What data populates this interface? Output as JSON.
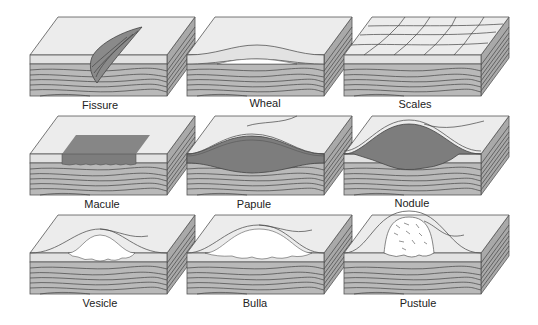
{
  "figure": {
    "type": "skin-lesion-diagram",
    "colors": {
      "surface": "#ececec",
      "epidermis": "#e2e2e2",
      "dermis": "#b9b9b9",
      "side": "#a9a9a9",
      "lesion": "#7d7d7d",
      "fluid": "#ffffff",
      "outline": "#555555"
    },
    "panels": [
      {
        "id": "fissure",
        "label": "Fissure",
        "row": 0,
        "col": 0
      },
      {
        "id": "wheal",
        "label": "Wheal",
        "row": 0,
        "col": 1
      },
      {
        "id": "scales",
        "label": "Scales",
        "row": 0,
        "col": 2
      },
      {
        "id": "macule",
        "label": "Macule",
        "row": 1,
        "col": 0
      },
      {
        "id": "papule",
        "label": "Papule",
        "row": 1,
        "col": 1
      },
      {
        "id": "nodule",
        "label": "Nodule",
        "row": 1,
        "col": 2
      },
      {
        "id": "vesicle",
        "label": "Vesicle",
        "row": 2,
        "col": 0
      },
      {
        "id": "bulla",
        "label": "Bulla",
        "row": 2,
        "col": 1
      },
      {
        "id": "pustule",
        "label": "Pustule",
        "row": 2,
        "col": 2
      }
    ]
  }
}
